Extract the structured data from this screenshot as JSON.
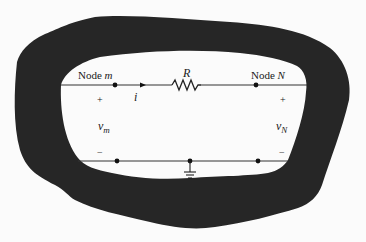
{
  "diagram": {
    "type": "circuit-schematic",
    "colors": {
      "background": "#fbfbfb",
      "blob": "#262626",
      "wire": "#333333",
      "text": "#1a1a1a"
    },
    "nodes": {
      "left": {
        "label_prefix": "Node ",
        "label_var": "m"
      },
      "right": {
        "label_prefix": "Node ",
        "label_var": "N"
      }
    },
    "resistor": {
      "label": "R"
    },
    "current": {
      "label": "i",
      "direction": "right"
    },
    "voltages": {
      "left": {
        "symbol": "v",
        "subscript": "m",
        "plus": "+",
        "minus": "−"
      },
      "right": {
        "symbol": "v",
        "subscript": "N",
        "plus": "+",
        "minus": "−"
      }
    },
    "ground": {
      "symbol": "ground-icon"
    }
  }
}
